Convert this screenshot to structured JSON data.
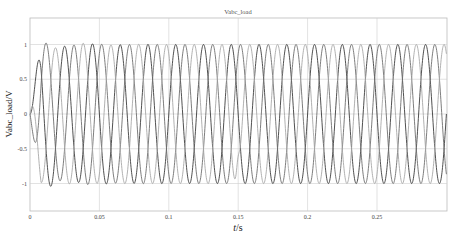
{
  "chart_data": {
    "type": "line",
    "title": "Vabc_load",
    "xlabel": "t/s",
    "ylabel": "Vabc_load/V",
    "xlim": [
      0,
      0.3
    ],
    "ylim": [
      -1.35,
      1.35
    ],
    "xticks": [
      0,
      0.05,
      0.1,
      0.15,
      0.2,
      0.25
    ],
    "xtick_labels": [
      "0",
      "0.05",
      "0.1",
      "0.15",
      "0.2",
      "0.25"
    ],
    "yticks": [
      1,
      0.5,
      0,
      -0.5,
      -1
    ],
    "ytick_labels": [
      "1",
      "0.5",
      "0",
      "-0.5",
      "-1"
    ],
    "grid": true,
    "legend": null,
    "frequency_hz": 50,
    "steady_state_amplitude": 1.0,
    "series": [
      {
        "name": "Va",
        "color": "#3c3c3c",
        "phase_deg": 0,
        "transient_peaks": [
          [
            0.005,
            0.5
          ],
          [
            0.0085,
            -0.8
          ],
          [
            0.0165,
            1.1
          ],
          [
            0.0235,
            -1.05
          ],
          [
            0.037,
            0.93
          ],
          [
            0.043,
            -0.97
          ]
        ]
      },
      {
        "name": "Vb",
        "color": "#6e6e6e",
        "phase_deg": -120,
        "transient_peaks": [
          [
            0.0145,
            -1.03
          ],
          [
            0.0245,
            1.07
          ],
          [
            0.0345,
            -0.97
          ],
          [
            0.046,
            0.95
          ]
        ]
      },
      {
        "name": "Vc",
        "color": "#a8a8a8",
        "phase_deg": 120,
        "transient_peaks": [
          [
            0.004,
            -0.2
          ],
          [
            0.0115,
            0.97
          ],
          [
            0.019,
            -1.1
          ],
          [
            0.0305,
            1.0
          ]
        ],
        "disturbance": {
          "t": 0.15,
          "min_peak": 0.65
        }
      }
    ]
  }
}
